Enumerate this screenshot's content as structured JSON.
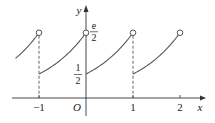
{
  "chart_data": {
    "type": "line",
    "function": "f(x) = e^(x - floor(x)) / 2",
    "x_range": [
      -1.5,
      2
    ],
    "pieces": [
      {
        "from": -1.5,
        "to": -1,
        "closed_start": false,
        "open_end": true
      },
      {
        "from": -1,
        "to": 0,
        "closed_start": true,
        "open_end": true
      },
      {
        "from": 0,
        "to": 1,
        "closed_start": true,
        "open_end": true
      },
      {
        "from": 1,
        "to": 2,
        "closed_start": true,
        "open_end": true
      }
    ],
    "jumps_at": [
      -1,
      1
    ],
    "x_ticks": [
      {
        "value": -1,
        "label": "−1"
      },
      {
        "value": 1,
        "label": "1"
      },
      {
        "value": 2,
        "label": "2"
      }
    ],
    "y_labels": [
      {
        "value": 0.5,
        "num": "1",
        "den": "2"
      },
      {
        "value": 1.3591,
        "num": "e",
        "den": "2"
      }
    ],
    "origin_label": "O",
    "xlabel": "x",
    "ylabel": "y",
    "colors": {
      "axis": "#333333",
      "curve": "#555555"
    }
  }
}
